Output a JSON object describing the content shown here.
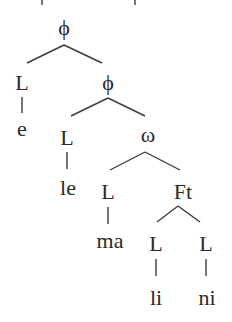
{
  "diagram": {
    "type": "prosodic-tree",
    "top_cutoff_text": "",
    "nodes": {
      "phi_root": "ϕ",
      "L1": "L",
      "phi_2": "ϕ",
      "e": "e",
      "L2": "L",
      "omega": "ω",
      "le": "le",
      "L3": "L",
      "Ft": "Ft",
      "ma": "ma",
      "L4": "L",
      "L5": "L",
      "li": "li",
      "ni": "ni"
    },
    "edges": [
      [
        "phi_root",
        "L1"
      ],
      [
        "phi_root",
        "phi_2"
      ],
      [
        "L1",
        "e"
      ],
      [
        "phi_2",
        "L2"
      ],
      [
        "phi_2",
        "omega"
      ],
      [
        "L2",
        "le"
      ],
      [
        "omega",
        "L3"
      ],
      [
        "omega",
        "Ft"
      ],
      [
        "L3",
        "ma"
      ],
      [
        "Ft",
        "L4"
      ],
      [
        "Ft",
        "L5"
      ],
      [
        "L4",
        "li"
      ],
      [
        "L5",
        "ni"
      ]
    ]
  }
}
